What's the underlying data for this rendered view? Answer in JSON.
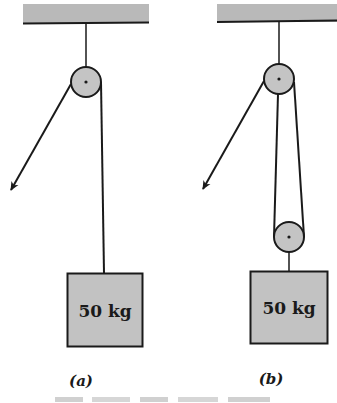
{
  "colors": {
    "background": "#ffffff",
    "ceiling_fill": "#b9b9b9",
    "pulley_fill": "#c4c4c4",
    "block_fill": "#c2c2c2",
    "line": "#1a1a1a"
  },
  "panels": [
    {
      "id": "a",
      "label": "(a)",
      "block": {
        "mass_label": "50 kg"
      },
      "pulleys": 1,
      "description": "Single fixed pulley; rope pulled down-left with arrow, other end holds 50 kg block"
    },
    {
      "id": "b",
      "label": "(b)",
      "block": {
        "mass_label": "50 kg"
      },
      "pulleys": 2,
      "description": "Fixed pulley plus movable pulley attached to 50 kg block; rope pulled down-left with arrow"
    }
  ],
  "caption": {
    "text": "",
    "note": "Caption line partially cropped and illegible at bottom edge"
  }
}
